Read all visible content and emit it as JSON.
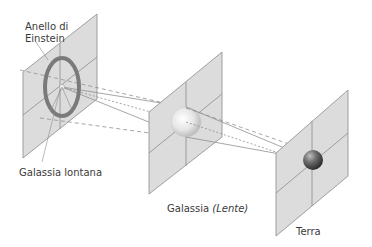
{
  "diagram": {
    "labels": {
      "einstein_ring_line1": "Anello di",
      "einstein_ring_line2": "Einstein",
      "distant_galaxy": "Galassia lontana",
      "lens_galaxy_prefix": "Galassia",
      "lens_galaxy_italic": "(Lente)",
      "earth": "Terra"
    },
    "colors": {
      "panel_fill": "#d9d9d9",
      "panel_stroke": "#8c8c8c",
      "ring": "#7a7a7a",
      "ray": "#8f8f8f",
      "text": "#3a3a3a"
    },
    "nodes": [
      {
        "id": "distant-galaxy",
        "label": "Galassia lontana"
      },
      {
        "id": "lens-galaxy",
        "label": "Galassia (Lente)"
      },
      {
        "id": "earth",
        "label": "Terra"
      },
      {
        "id": "einstein-ring",
        "label": "Anello di Einstein"
      }
    ]
  }
}
